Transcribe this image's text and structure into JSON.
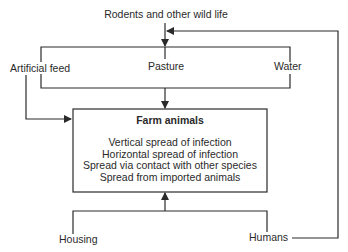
{
  "diagram": {
    "sources": {
      "top": "Rodents and other wild life",
      "artificial_feed": "Artificial feed",
      "pasture": "Pasture",
      "water": "Water",
      "housing": "Housing",
      "humans": "Humans"
    },
    "target": {
      "title": "Farm animals",
      "lines": [
        "Vertical spread of infection",
        "Horizontal spread of infection",
        "Spread via contact with other species",
        "Spread from imported animals"
      ]
    },
    "colors": {
      "line": "#2a2a2a",
      "text": "#2a2a2a",
      "background": "#ffffff"
    }
  }
}
